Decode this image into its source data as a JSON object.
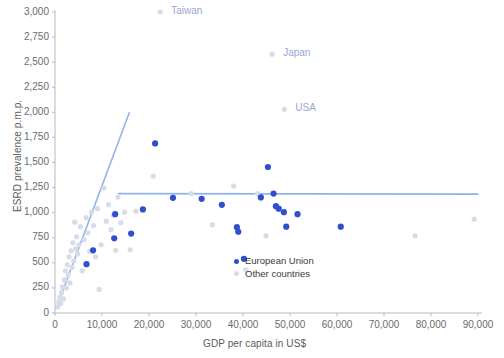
{
  "chart_data": {
    "type": "scatter",
    "title": "",
    "xlabel": "GDP per capita in US$",
    "ylabel": "ESRD prevalence p.m.p.",
    "xlim": [
      0,
      90000
    ],
    "ylim": [
      0,
      3000
    ],
    "xticks": [
      0,
      10000,
      20000,
      30000,
      40000,
      50000,
      60000,
      70000,
      80000,
      90000
    ],
    "xtick_labels": [
      "0",
      "10,000",
      "20,000",
      "30,000",
      "40,000",
      "50,000",
      "60,000",
      "70,000",
      "80,000",
      "90,000"
    ],
    "yticks": [
      0,
      250,
      500,
      750,
      1000,
      1250,
      1500,
      1750,
      2000,
      2250,
      2500,
      2750,
      3000
    ],
    "ytick_labels": [
      "0",
      "250",
      "500",
      "750",
      "1,000",
      "1,250",
      "1,500",
      "1,750",
      "2,000",
      "2,250",
      "2,500",
      "2,750",
      "3,000"
    ],
    "grid": false,
    "legend_position": "inside-lower-right",
    "series": [
      {
        "name": "European Union",
        "color": "#2f4fcf",
        "marker": "circle",
        "points": [
          [
            6700,
            487
          ],
          [
            8100,
            625
          ],
          [
            12600,
            745
          ],
          [
            12800,
            985
          ],
          [
            16200,
            792
          ],
          [
            18700,
            1032
          ],
          [
            21300,
            1690
          ],
          [
            25100,
            1148
          ],
          [
            31200,
            1138
          ],
          [
            35500,
            1078
          ],
          [
            38700,
            855
          ],
          [
            39000,
            810
          ],
          [
            40200,
            540
          ],
          [
            43800,
            1152
          ],
          [
            45300,
            1455
          ],
          [
            46500,
            1190
          ],
          [
            47000,
            1065
          ],
          [
            47600,
            1040
          ],
          [
            48700,
            1005
          ],
          [
            49200,
            860
          ],
          [
            51600,
            985
          ],
          [
            60800,
            860
          ]
        ]
      },
      {
        "name": "Other countries",
        "color": "#d8dce8",
        "marker": "circle",
        "points": [
          [
            600,
            60
          ],
          [
            800,
            110
          ],
          [
            1000,
            155
          ],
          [
            1200,
            95
          ],
          [
            1400,
            205
          ],
          [
            1600,
            260
          ],
          [
            1800,
            140
          ],
          [
            2000,
            330
          ],
          [
            2200,
            420
          ],
          [
            2400,
            250
          ],
          [
            2600,
            480
          ],
          [
            2800,
            380
          ],
          [
            3000,
            560
          ],
          [
            3200,
            300
          ],
          [
            3400,
            620
          ],
          [
            3600,
            455
          ],
          [
            3800,
            700
          ],
          [
            4000,
            520
          ],
          [
            4200,
            905
          ],
          [
            4400,
            640
          ],
          [
            4600,
            760
          ],
          [
            4800,
            590
          ],
          [
            5100,
            680
          ],
          [
            5400,
            860
          ],
          [
            5800,
            420
          ],
          [
            6200,
            730
          ],
          [
            6600,
            950
          ],
          [
            7000,
            800
          ],
          [
            7400,
            615
          ],
          [
            7800,
            1005
          ],
          [
            8200,
            870
          ],
          [
            8600,
            560
          ],
          [
            9000,
            1040
          ],
          [
            9400,
            235
          ],
          [
            9800,
            680
          ],
          [
            10400,
            1245
          ],
          [
            10900,
            915
          ],
          [
            11400,
            1080
          ],
          [
            11900,
            830
          ],
          [
            12400,
            975
          ],
          [
            12900,
            625
          ],
          [
            13400,
            1155
          ],
          [
            14000,
            900
          ],
          [
            14800,
            1005
          ],
          [
            16000,
            630
          ],
          [
            17200,
            1015
          ],
          [
            20900,
            1365
          ],
          [
            22400,
            3000
          ],
          [
            29000,
            1190
          ],
          [
            33500,
            880
          ],
          [
            38000,
            1265
          ],
          [
            40600,
            430
          ],
          [
            43100,
            1190
          ],
          [
            44900,
            770
          ],
          [
            46200,
            2580
          ],
          [
            48800,
            2030
          ],
          [
            76600,
            770
          ],
          [
            89200,
            935
          ]
        ]
      }
    ],
    "trend_lines": [
      {
        "name": "rising-segment",
        "color": "#8fb4e8",
        "x0": 300,
        "y0": 50,
        "x1": 15800,
        "y1": 1995
      },
      {
        "name": "plateau-segment",
        "color": "#8fb4e8",
        "x0": 13500,
        "y0": 1190,
        "x1": 90000,
        "y1": 1185
      }
    ],
    "annotations": [
      {
        "label": "Taiwan",
        "x": 22400,
        "y": 3000,
        "text_dx": 11,
        "text_dy": -0.5
      },
      {
        "label": "Japan",
        "x": 46200,
        "y": 2580,
        "text_dx": 11,
        "text_dy": -0.5
      },
      {
        "label": "USA",
        "x": 48800,
        "y": 2030,
        "text_dx": 11,
        "text_dy": -0.5
      }
    ],
    "annotation_color": "#9aa7d4"
  },
  "legend": {
    "items": [
      {
        "label": "European Union",
        "color": "#2f4fcf"
      },
      {
        "label": "Other countries",
        "color": "#d8dce8"
      }
    ]
  },
  "axes": {
    "x_title": "GDP per capita in US$",
    "y_title": "ESRD prevalence p.m.p.",
    "axis_color": "#b9b9b9",
    "tick_color": "#6b6b6b"
  }
}
